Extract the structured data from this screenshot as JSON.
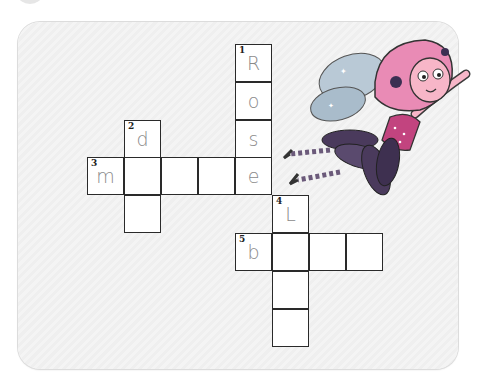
{
  "puzzle": {
    "type": "crossword",
    "cell_size_px": 37,
    "origin": {
      "x": 87,
      "y": 44
    },
    "clues": [
      {
        "number": 1,
        "direction": "down",
        "start": {
          "col": 4,
          "row": 0
        },
        "length": 4,
        "word_partial": "Rose"
      },
      {
        "number": 2,
        "direction": "down",
        "start": {
          "col": 1,
          "row": 2
        },
        "length": 3,
        "word_partial": "d"
      },
      {
        "number": 3,
        "direction": "across",
        "start": {
          "col": 0,
          "row": 3
        },
        "length": 5,
        "word_partial": "m___e"
      },
      {
        "number": 4,
        "direction": "down",
        "start": {
          "col": 5,
          "row": 4
        },
        "length": 4,
        "word_partial": "L"
      },
      {
        "number": 5,
        "direction": "across",
        "start": {
          "col": 4,
          "row": 5
        },
        "length": 4,
        "word_partial": "b"
      }
    ],
    "cells": [
      {
        "col": 4,
        "row": 0,
        "num": "1",
        "letter": "R"
      },
      {
        "col": 4,
        "row": 1,
        "num": "",
        "letter": "o"
      },
      {
        "col": 4,
        "row": 2,
        "num": "",
        "letter": "s"
      },
      {
        "col": 1,
        "row": 2,
        "num": "2",
        "letter": "d"
      },
      {
        "col": 0,
        "row": 3,
        "num": "3",
        "letter": "m"
      },
      {
        "col": 1,
        "row": 3,
        "num": "",
        "letter": ""
      },
      {
        "col": 2,
        "row": 3,
        "num": "",
        "letter": ""
      },
      {
        "col": 3,
        "row": 3,
        "num": "",
        "letter": ""
      },
      {
        "col": 4,
        "row": 3,
        "num": "",
        "letter": "e"
      },
      {
        "col": 1,
        "row": 4,
        "num": "",
        "letter": ""
      },
      {
        "col": 5,
        "row": 4,
        "num": "4",
        "letter": "L"
      },
      {
        "col": 4,
        "row": 5,
        "num": "5",
        "letter": "b"
      },
      {
        "col": 5,
        "row": 5,
        "num": "",
        "letter": ""
      },
      {
        "col": 6,
        "row": 5,
        "num": "",
        "letter": ""
      },
      {
        "col": 7,
        "row": 5,
        "num": "",
        "letter": ""
      },
      {
        "col": 5,
        "row": 6,
        "num": "",
        "letter": ""
      },
      {
        "col": 5,
        "row": 7,
        "num": "",
        "letter": ""
      }
    ]
  },
  "illustration": {
    "subject": "flying-fairy",
    "colors": {
      "hair": "#e98bb5",
      "skin": "#f7b6c8",
      "wings": "#b9c9d6",
      "dress": "#c2447f",
      "skirt": "#4a3a5c",
      "stripes": "#6b5a7a",
      "flower": "#3b2f52"
    }
  },
  "colors": {
    "card_bg": "#f1f1f1",
    "cell_border": "#2a2a2a",
    "letter": "#8a8a8a"
  }
}
